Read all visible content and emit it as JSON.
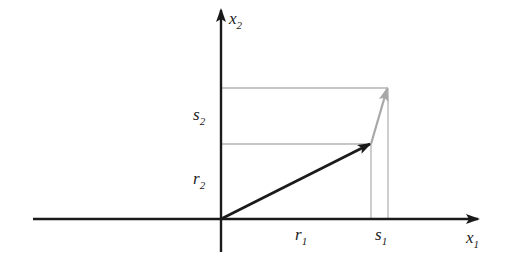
{
  "diagram": {
    "colors": {
      "axis": "#1a1a1a",
      "vector_r": "#1a1a1a",
      "vector_delta": "#a8a8a8",
      "guide_lines": "#b4b4b4",
      "text": "#222222"
    },
    "axes": {
      "x1": {
        "base": "x",
        "sub": "1"
      },
      "x2": {
        "base": "x",
        "sub": "2"
      }
    },
    "labels": {
      "r1": {
        "base": "r",
        "sub": "1"
      },
      "s1": {
        "base": "s",
        "sub": "1"
      },
      "r2": {
        "base": "r",
        "sub": "2"
      },
      "s2": {
        "base": "s",
        "sub": "2"
      }
    },
    "points": {
      "origin": [
        221,
        219
      ],
      "r": [
        371,
        144
      ],
      "s": [
        388,
        88
      ]
    }
  }
}
